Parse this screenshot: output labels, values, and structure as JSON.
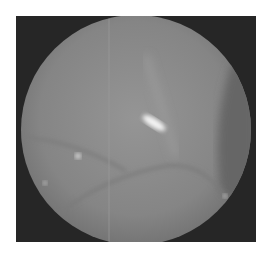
{
  "image": {
    "description": "Grayscale circular fundus/endoscopic view on dark background",
    "background_color": "#262626",
    "disc_color": "#8a8a8a",
    "highlight_color": "#f4f4f4"
  }
}
